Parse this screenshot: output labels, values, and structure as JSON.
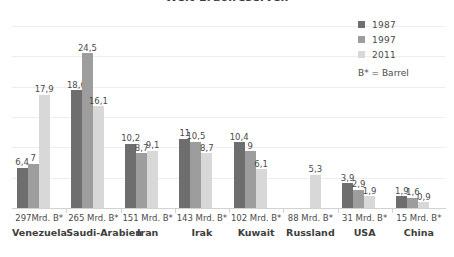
{
  "chart_data": {
    "type": "bar",
    "title": "Welt-Erdölreserven",
    "xlabel": "",
    "ylabel": "",
    "ylim": [
      0,
      28.8
    ],
    "grid": true,
    "legend_position": "top-right",
    "legend_note": "B* = Barrel",
    "value_decimal_separator": ",",
    "categories": [
      "Venezuela",
      "Saudi-Arabien",
      "Iran",
      "Irak",
      "Kuwait",
      "Russland",
      "USA",
      "China"
    ],
    "category_reserves": [
      "297Mrd. B*",
      "265 Mrd. B*",
      "151 Mrd. B*",
      "143 Mrd. B*",
      "102 Mrd. B*",
      "88 Mrd. B*",
      "31 Mrd. B*",
      "15 Mrd. B*"
    ],
    "series": [
      {
        "name": "1987",
        "color": "#6e6e6e",
        "values": [
          6.4,
          18.6,
          10.2,
          11,
          10.4,
          null,
          3.9,
          1.9
        ],
        "labels": [
          "6,4",
          "18,6",
          "10,2",
          "11",
          "10,4",
          "",
          "3,9",
          "1,9"
        ]
      },
      {
        "name": "1997",
        "color": "#9d9d9d",
        "values": [
          7,
          24.5,
          8.7,
          10.5,
          9,
          null,
          2.9,
          1.6
        ],
        "labels": [
          "7",
          "24,5",
          "8,7",
          "10,5",
          "9",
          "",
          "2,9",
          "1,6"
        ]
      },
      {
        "name": "2011",
        "color": "#d8d8d8",
        "values": [
          17.9,
          16.1,
          9.1,
          8.7,
          6.1,
          5.3,
          1.9,
          0.9
        ],
        "labels": [
          "17,9",
          "16,1",
          "9,1",
          "8,7",
          "6,1",
          "5,3",
          "1,9",
          "0,9"
        ]
      }
    ]
  },
  "legend": {
    "items": [
      {
        "label": "1987"
      },
      {
        "label": "1997"
      },
      {
        "label": "2011"
      }
    ],
    "note": "B* = Barrel"
  }
}
